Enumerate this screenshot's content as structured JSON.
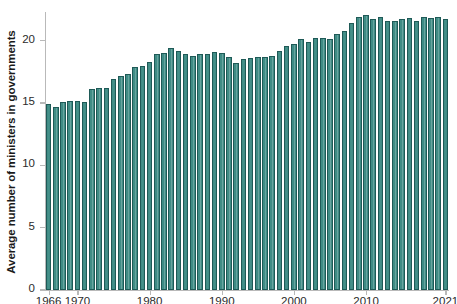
{
  "chart_data": {
    "type": "bar",
    "title": "",
    "xlabel": "",
    "ylabel": "Average number of ministers in governments",
    "xlim": [
      1965.5,
      2021.5
    ],
    "ylim": [
      0,
      22.3
    ],
    "grid": false,
    "legend": null,
    "bar_color": "#3f8c85",
    "bar_edge_color": "#1f5a57",
    "axis_color": "#b9b9b9",
    "yticks": [
      0,
      5,
      10,
      15,
      20
    ],
    "ytick_labels": [
      "0",
      "5",
      "10",
      "15",
      "20"
    ],
    "xticks": [
      1966,
      1970,
      1980,
      1990,
      2000,
      2010,
      2021
    ],
    "xtick_labels": [
      "1966",
      "1970",
      "1980",
      "1990",
      "2000",
      "2010",
      "2021"
    ],
    "categories": [
      1966,
      1967,
      1968,
      1969,
      1970,
      1971,
      1972,
      1973,
      1974,
      1975,
      1976,
      1977,
      1978,
      1979,
      1980,
      1981,
      1982,
      1983,
      1984,
      1985,
      1986,
      1987,
      1988,
      1989,
      1990,
      1991,
      1992,
      1993,
      1994,
      1995,
      1996,
      1997,
      1998,
      1999,
      2000,
      2001,
      2002,
      2003,
      2004,
      2005,
      2006,
      2007,
      2008,
      2009,
      2010,
      2011,
      2012,
      2013,
      2014,
      2015,
      2016,
      2017,
      2018,
      2019,
      2020,
      2021
    ],
    "values": [
      14.9,
      14.7,
      15.1,
      15.2,
      15.2,
      15.1,
      16.1,
      16.2,
      16.2,
      16.9,
      17.2,
      17.3,
      17.9,
      18.0,
      18.3,
      18.9,
      19.0,
      19.4,
      19.2,
      18.9,
      18.8,
      18.9,
      18.9,
      19.1,
      19.0,
      18.7,
      18.2,
      18.5,
      18.6,
      18.7,
      18.7,
      18.8,
      19.2,
      19.6,
      19.7,
      20.1,
      19.9,
      20.2,
      20.2,
      20.1,
      20.5,
      20.8,
      21.4,
      21.9,
      22.1,
      21.7,
      21.9,
      21.6,
      21.6,
      21.7,
      21.8,
      21.6,
      21.9,
      21.8,
      21.9,
      21.7
    ]
  }
}
